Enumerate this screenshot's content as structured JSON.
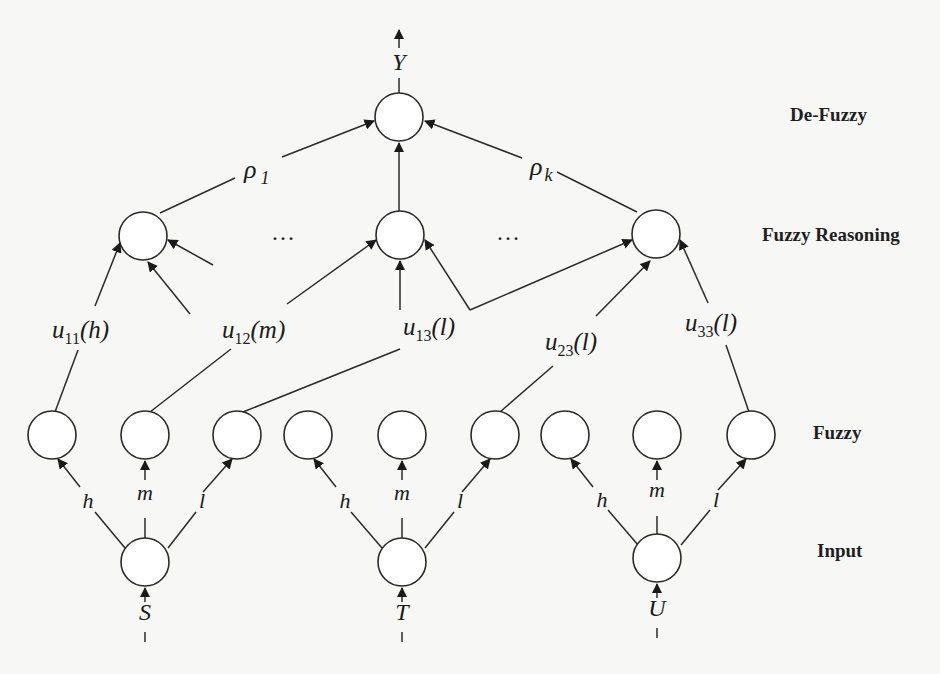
{
  "figure": {
    "layers": {
      "defuzzy": "De-Fuzzy",
      "reasoning": "Fuzzy Reasoning",
      "fuzzy": "Fuzzy",
      "input": "Input"
    },
    "output_label": "Y",
    "weights": {
      "first": "ρ",
      "first_sub": "1",
      "last": "ρ",
      "last_sub": "k"
    },
    "ellipsis": "…",
    "inputs": [
      {
        "label": "S",
        "branches": [
          "h",
          "m",
          "l"
        ]
      },
      {
        "label": "T",
        "branches": [
          "h",
          "m",
          "l"
        ]
      },
      {
        "label": "U",
        "branches": [
          "h",
          "m",
          "l"
        ]
      }
    ],
    "rule_terms": [
      {
        "base": "u",
        "sub": "11",
        "arg": "(h)"
      },
      {
        "base": "u",
        "sub": "12",
        "arg": "(m)"
      },
      {
        "base": "u",
        "sub": "13",
        "arg": "(l)"
      },
      {
        "base": "u",
        "sub": "23",
        "arg": "(l)"
      },
      {
        "base": "u",
        "sub": "33",
        "arg": "(l)"
      }
    ]
  }
}
